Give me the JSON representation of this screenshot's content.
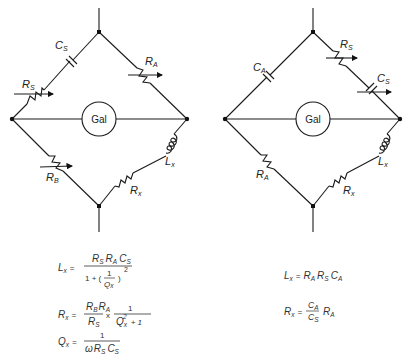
{
  "left_bridge": {
    "galvanometer_label": "Gal",
    "components": {
      "cs": {
        "main": "C",
        "sub": "S"
      },
      "rs": {
        "main": "R",
        "sub": "S"
      },
      "ra": {
        "main": "R",
        "sub": "A"
      },
      "rb": {
        "main": "R",
        "sub": "B"
      },
      "lx": {
        "main": "L",
        "sub": "x"
      },
      "rx": {
        "main": "R",
        "sub": "x"
      }
    },
    "equations": {
      "lx": {
        "lhs": "L",
        "lhs_sub": "x",
        "eq": "=",
        "numerator": "R_S R_A C_S",
        "den_prefix": "1 + (",
        "den_frac_num": "1",
        "den_frac_den": "Q",
        "den_frac_den_sub": "x",
        "den_suffix": ")",
        "den_exp": "2",
        "num_parts": [
          {
            "m": "R",
            "s": "S"
          },
          {
            "m": "R",
            "s": "A"
          },
          {
            "m": "C",
            "s": "S"
          }
        ]
      },
      "rx": {
        "lhs": "R",
        "lhs_sub": "x",
        "eq": "=",
        "num_parts": [
          {
            "m": "R",
            "s": "B"
          },
          {
            "m": "R",
            "s": "A"
          }
        ],
        "den_main": "R",
        "den_sub": "S",
        "times": "x",
        "frac2_num": "1",
        "frac2_den_main": "Q",
        "frac2_den_sub": "x",
        "frac2_den_exp": "2",
        "frac2_den_suffix": "+ 1"
      },
      "qx": {
        "lhs": "Q",
        "lhs_sub": "x",
        "eq": "=",
        "numerator": "1",
        "den_omega": "ω",
        "den_parts": [
          {
            "m": "R",
            "s": "S"
          },
          {
            "m": "C",
            "s": "S"
          }
        ]
      }
    }
  },
  "right_bridge": {
    "galvanometer_label": "Gal",
    "components": {
      "ca": {
        "main": "C",
        "sub": "A"
      },
      "rs": {
        "main": "R",
        "sub": "S"
      },
      "cs": {
        "main": "C",
        "sub": "S"
      },
      "ra": {
        "main": "R",
        "sub": "A"
      },
      "lx": {
        "main": "L",
        "sub": "x"
      },
      "rx": {
        "main": "R",
        "sub": "x"
      }
    },
    "equations": {
      "lx": {
        "lhs": "L",
        "lhs_sub": "x",
        "eq": "=",
        "rhs_parts": [
          {
            "m": "R",
            "s": "A"
          },
          {
            "m": "R",
            "s": "S"
          },
          {
            "m": "C",
            "s": "A"
          }
        ]
      },
      "rx": {
        "lhs": "R",
        "lhs_sub": "x",
        "eq": "=",
        "frac_num_main": "C",
        "frac_num_sub": "A",
        "frac_den_main": "C",
        "frac_den_sub": "S",
        "tail_main": "R",
        "tail_sub": "A"
      }
    }
  }
}
